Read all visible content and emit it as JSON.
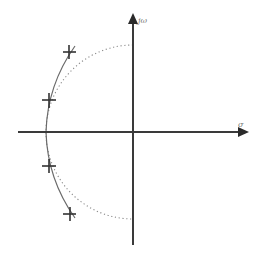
{
  "diagram": {
    "title": "",
    "type": "s-plane pole plot (Butterworth vs Chebyshev-style pole locations)",
    "axes": {
      "real_label": "σ",
      "imag_label": "jω"
    },
    "elements": {
      "unit_circle": "dotted semicircle in left half-plane",
      "pole_arc": "solid elliptical arc through poles",
      "pole_marker": "+"
    },
    "poles": [
      {
        "id": "p1",
        "position": "upper-outer"
      },
      {
        "id": "p2",
        "position": "upper-inner"
      },
      {
        "id": "p3",
        "position": "lower-inner"
      },
      {
        "id": "p4",
        "position": "lower-outer"
      }
    ],
    "colors": {
      "axis": "#3a3a3a",
      "dotted_circle": "#8a8a8a",
      "arc": "#6a6a6a",
      "pole": "#333333"
    }
  }
}
